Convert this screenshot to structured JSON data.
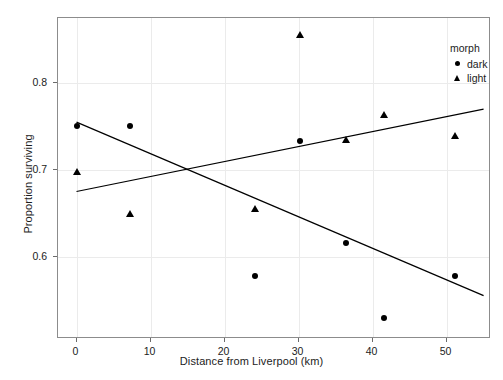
{
  "chart_data": {
    "type": "scatter",
    "title": "",
    "xlabel": "Distance from Liverpool (km)",
    "ylabel": "Proportion surviving",
    "xlim": [
      -2.5,
      56.0
    ],
    "ylim": [
      0.505,
      0.875
    ],
    "xticks": [
      0,
      10,
      20,
      30,
      40,
      50
    ],
    "xticklabels": [
      "0",
      "10",
      "20",
      "30",
      "40",
      "50"
    ],
    "yticks": [
      0.6,
      0.7,
      0.8
    ],
    "yticklabels": [
      "0.6",
      "0.7",
      "0.8"
    ],
    "grid": true,
    "legend": {
      "title": "morph",
      "position": "top-right-inside",
      "entries": [
        {
          "label": "dark",
          "marker": "circle"
        },
        {
          "label": "light",
          "marker": "triangle"
        }
      ]
    },
    "series": [
      {
        "name": "dark",
        "marker": "circle",
        "points": [
          {
            "x": 0.0,
            "y": 0.75
          },
          {
            "x": 7.2,
            "y": 0.75
          },
          {
            "x": 24.1,
            "y": 0.578
          },
          {
            "x": 30.2,
            "y": 0.733
          },
          {
            "x": 36.4,
            "y": 0.616
          },
          {
            "x": 41.5,
            "y": 0.529
          },
          {
            "x": 51.2,
            "y": 0.578
          }
        ],
        "fit_line": {
          "x1": 0.0,
          "y1": 0.755,
          "x2": 55.0,
          "y2": 0.555
        }
      },
      {
        "name": "light",
        "marker": "triangle",
        "points": [
          {
            "x": 0.0,
            "y": 0.698
          },
          {
            "x": 7.2,
            "y": 0.649
          },
          {
            "x": 24.1,
            "y": 0.655
          },
          {
            "x": 30.2,
            "y": 0.855
          },
          {
            "x": 36.4,
            "y": 0.734
          },
          {
            "x": 41.5,
            "y": 0.763
          },
          {
            "x": 51.2,
            "y": 0.739
          }
        ],
        "fit_line": {
          "x1": 0.0,
          "y1": 0.675,
          "x2": 55.0,
          "y2": 0.77
        }
      }
    ]
  },
  "axes": {
    "x_title": "Distance from Liverpool (km)",
    "y_title": "Proportion surviving"
  },
  "legend": {
    "title": "morph",
    "dark_label": "dark",
    "light_label": "light"
  },
  "colors": {
    "marker": "#000000",
    "panel_border": "#8c8c8c",
    "gridline": "#ebebeb",
    "background": "#ffffff",
    "text": "#1c1c1c"
  }
}
